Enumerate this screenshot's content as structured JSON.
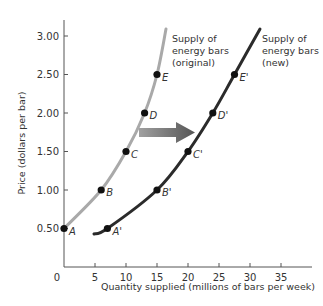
{
  "chart_data": {
    "type": "line",
    "title": "",
    "xlabel": "Quantity supplied (millions of bars per week)",
    "ylabel": "Price (dollars per bar)",
    "xlim": [
      0,
      40
    ],
    "ylim": [
      0,
      3.2
    ],
    "x_ticks": [
      0,
      5,
      10,
      15,
      20,
      25,
      30,
      35
    ],
    "x_tick_labels": [
      "0",
      "5",
      "10",
      "15",
      "20",
      "25",
      "30",
      "35"
    ],
    "y_ticks": [
      0.5,
      1.0,
      1.5,
      2.0,
      2.5,
      3.0
    ],
    "y_tick_labels": [
      "0.50",
      "1.00",
      "1.50",
      "2.00",
      "2.50",
      "3.00"
    ],
    "grid": false,
    "series": [
      {
        "name": "Supply of energy bars (original)",
        "label_lines": [
          "Supply of",
          "energy bars",
          "(original)"
        ],
        "color": "#a9a9a9",
        "points": [
          {
            "label": "A",
            "x": 0,
            "y": 0.5
          },
          {
            "label": "B",
            "x": 6,
            "y": 1.0
          },
          {
            "label": "C",
            "x": 10,
            "y": 1.5
          },
          {
            "label": "D",
            "x": 13,
            "y": 2.0
          },
          {
            "label": "E",
            "x": 15,
            "y": 2.5
          }
        ]
      },
      {
        "name": "Supply of energy bars (new)",
        "label_lines": [
          "Supply of",
          "energy bars",
          "(new)"
        ],
        "color": "#2b2b2b",
        "points": [
          {
            "label": "A'",
            "x": 7,
            "y": 0.5
          },
          {
            "label": "B'",
            "x": 15,
            "y": 1.0
          },
          {
            "label": "C'",
            "x": 20,
            "y": 1.5
          },
          {
            "label": "D'",
            "x": 24,
            "y": 2.0
          },
          {
            "label": "E'",
            "x": 27.5,
            "y": 2.5
          }
        ]
      }
    ],
    "annotations": [
      {
        "type": "arrow",
        "direction": "right",
        "from": [
          12,
          1.75
        ],
        "to": [
          21,
          1.75
        ],
        "meaning": "increase in supply (rightward shift)"
      }
    ],
    "legend": "none (curves labeled directly)"
  }
}
